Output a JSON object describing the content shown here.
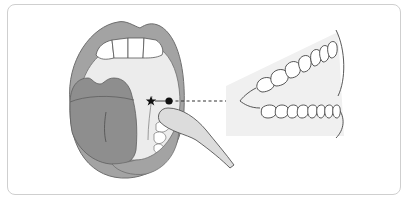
{
  "figure": {
    "markers": {
      "star": "star-marker",
      "swab_point": "filled-dot",
      "teeth_point": "filled-dot"
    },
    "colors": {
      "lip": "#a3a3a3",
      "lip_stroke": "#6e6e6e",
      "mouth_interior": "#ececec",
      "tongue": "#8e8e8e",
      "teeth": "#ffffff",
      "swab": "#dcdcdc",
      "teeth_panel_bg": "#f0f0f0",
      "frame_border": "#cfcfcf",
      "marker": "#111111"
    }
  }
}
